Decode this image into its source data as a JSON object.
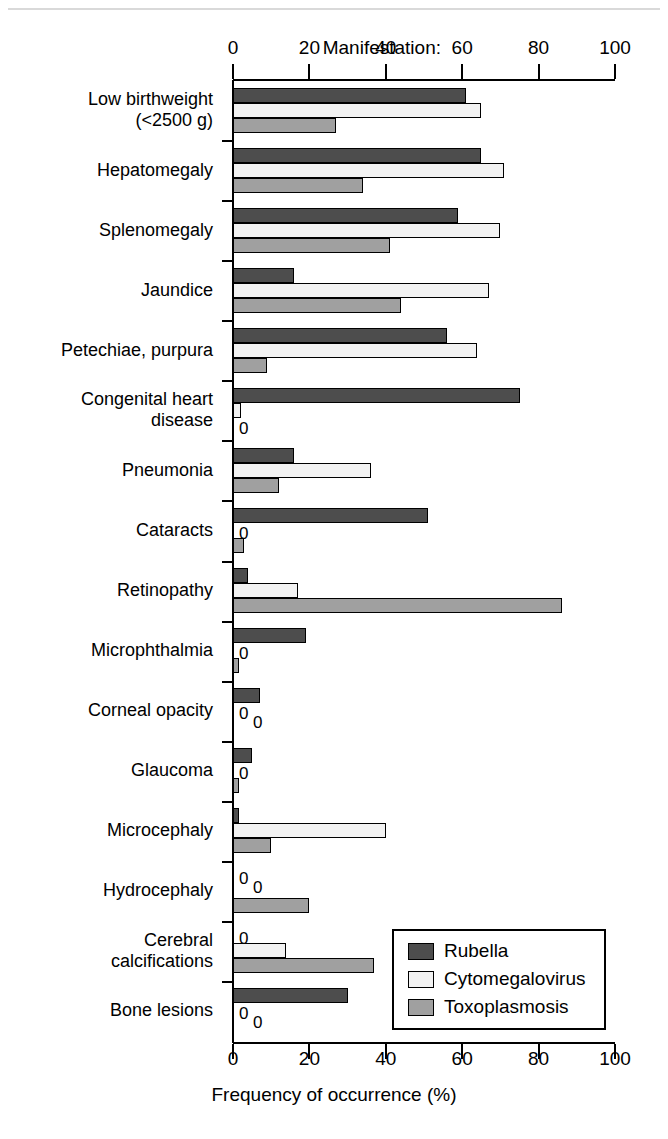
{
  "header": {
    "manifestation_label": "Manifestation:"
  },
  "axis": {
    "x_title": "Frequency of occurrence (%)",
    "x_ticks": [
      0,
      20,
      40,
      60,
      80,
      100
    ],
    "x_tick_labels": [
      "0",
      "20",
      "40",
      "60",
      "80",
      "100"
    ],
    "xmin": 0,
    "xmax": 100,
    "zero_marker": "0"
  },
  "legend": {
    "position": "inside-bottom-right",
    "entries": [
      {
        "label": "Rubella",
        "key": "rubella",
        "color": "#4d4d4d"
      },
      {
        "label": "Cytomegalovirus",
        "key": "cmv",
        "color": "#f2f2f2"
      },
      {
        "label": "Toxoplasmosis",
        "key": "toxo",
        "color": "#a0a0a0"
      }
    ]
  },
  "chart_data": {
    "type": "bar",
    "orientation": "horizontal",
    "title": "",
    "subtitle": "",
    "xlabel": "Frequency of occurrence (%)",
    "ylabel": "Manifestation:",
    "xlim": [
      0,
      100
    ],
    "xticks": [
      0,
      20,
      40,
      60,
      80,
      100
    ],
    "grid": false,
    "legend_position": "inside-bottom-right",
    "categories": [
      "Low birthweight\n(<2500 g)",
      "Hepatomegaly",
      "Splenomegaly",
      "Jaundice",
      "Petechiae, purpura",
      "Congenital heart\ndisease",
      "Pneumonia",
      "Cataracts",
      "Retinopathy",
      "Microphthalmia",
      "Corneal opacity",
      "Glaucoma",
      "Microcephaly",
      "Hydrocephaly",
      "Cerebral\ncalcifications",
      "Bone lesions"
    ],
    "series": [
      {
        "name": "Rubella",
        "color": "#4d4d4d",
        "values": [
          61,
          65,
          59,
          16,
          56,
          75,
          16,
          51,
          4,
          19,
          7,
          5,
          1.5,
          0,
          0,
          30
        ]
      },
      {
        "name": "Cytomegalovirus",
        "color": "#f2f2f2",
        "values": [
          65,
          71,
          70,
          67,
          64,
          2,
          36,
          0,
          17,
          0,
          0,
          0,
          40,
          0,
          14,
          0
        ]
      },
      {
        "name": "Toxoplasmosis",
        "color": "#a0a0a0",
        "values": [
          27,
          34,
          41,
          44,
          9,
          0,
          12,
          3,
          86,
          1.5,
          0,
          1.5,
          10,
          20,
          37,
          0
        ]
      }
    ],
    "zero_annotations": [
      {
        "category": "Congenital heart\ndisease",
        "series": "Toxoplasmosis",
        "text": "0"
      },
      {
        "category": "Cataracts",
        "series": "Cytomegalovirus",
        "text": "0"
      },
      {
        "category": "Microphthalmia",
        "series": "Cytomegalovirus",
        "text": "0"
      },
      {
        "category": "Corneal opacity",
        "series": "Cytomegalovirus",
        "text": "0"
      },
      {
        "category": "Corneal opacity",
        "series": "Toxoplasmosis",
        "text": "0"
      },
      {
        "category": "Glaucoma",
        "series": "Cytomegalovirus",
        "text": "0"
      },
      {
        "category": "Hydrocephaly",
        "series": "Rubella",
        "text": "0"
      },
      {
        "category": "Hydrocephaly",
        "series": "Cytomegalovirus",
        "text": "0"
      },
      {
        "category": "Cerebral\ncalcifications",
        "series": "Rubella",
        "text": "0"
      },
      {
        "category": "Bone lesions",
        "series": "Cytomegalovirus",
        "text": "0"
      },
      {
        "category": "Bone lesions",
        "series": "Toxoplasmosis",
        "text": "0"
      }
    ]
  }
}
